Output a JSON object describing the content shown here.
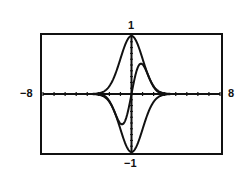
{
  "chart_data": {
    "type": "line",
    "title": "",
    "xlabel": "",
    "ylabel": "",
    "xlim": [
      -8,
      8
    ],
    "ylim": [
      -1,
      1
    ],
    "grid": false,
    "legend": null,
    "tick_labels": {
      "x_min": "-8",
      "x_max": "8",
      "y_min": "-1",
      "y_max": "1"
    },
    "x_ticks_every": 1,
    "y_ticks_every": 0.1,
    "series": [
      {
        "name": "upper envelope",
        "formula": "e^(-x^2/2)",
        "x": [
          -8,
          -3,
          -2.5,
          -2,
          -1.5,
          -1,
          -0.5,
          0,
          0.5,
          1,
          1.5,
          2,
          2.5,
          3,
          8
        ],
        "values": [
          0,
          0.01,
          0.04,
          0.14,
          0.32,
          0.61,
          0.88,
          1,
          0.88,
          0.61,
          0.32,
          0.14,
          0.04,
          0.01,
          0
        ]
      },
      {
        "name": "lower envelope",
        "formula": "-e^(-x^2/2)",
        "x": [
          -8,
          -3,
          -2.5,
          -2,
          -1.5,
          -1,
          -0.5,
          0,
          0.5,
          1,
          1.5,
          2,
          2.5,
          3,
          8
        ],
        "values": [
          0,
          -0.01,
          -0.04,
          -0.14,
          -0.32,
          -0.61,
          -0.88,
          -1,
          -0.88,
          -0.61,
          -0.32,
          -0.14,
          -0.04,
          -0.01,
          0
        ]
      },
      {
        "name": "damped curve",
        "formula": "e^(-x^2/2)·sin(x)",
        "x": [
          -8,
          -3,
          -2.5,
          -2,
          -1.5,
          -1,
          -0.8,
          -0.5,
          0,
          0.5,
          0.8,
          1,
          1.5,
          2,
          2.5,
          3,
          8
        ],
        "values": [
          0,
          0,
          -0.03,
          -0.12,
          -0.32,
          -0.51,
          -0.52,
          -0.42,
          0,
          0.42,
          0.52,
          0.51,
          0.32,
          0.12,
          0.03,
          0,
          0
        ]
      }
    ]
  },
  "labels": {
    "top": "1",
    "bottom": "−1",
    "left": "−8",
    "right": "8"
  }
}
